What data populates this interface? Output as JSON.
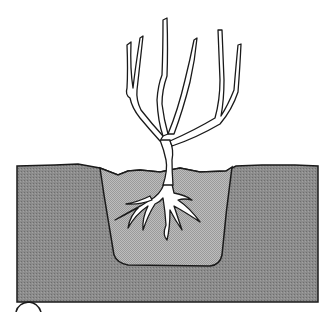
{
  "illustration": {
    "subject": "Tree sapling planted in a dug hole",
    "step_marker": "",
    "colors": {
      "background": "#ffffff",
      "soil": "#8a8a8a",
      "backfill": "#b4b4b4",
      "outline": "#1a1a1a",
      "tree_fill": "#ffffff"
    },
    "labels": []
  }
}
